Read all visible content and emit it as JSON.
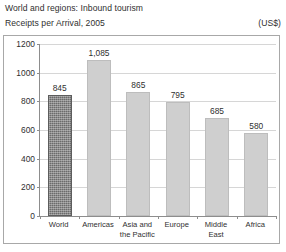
{
  "header": {
    "title_line1": "World and regions: Inbound tourism",
    "title_line2": "Receipts per Arrival, 2005",
    "units": "(US$)"
  },
  "chart_data": {
    "type": "bar",
    "xlabel": "",
    "ylabel": "",
    "units": "(US$)",
    "ylim": [
      0,
      1200
    ],
    "ytick_step": 200,
    "yticks": [
      "1200",
      "1000",
      "800",
      "600",
      "400",
      "200",
      "0"
    ],
    "ytick_values": [
      1200,
      1000,
      800,
      600,
      400,
      200,
      0
    ],
    "grid": true,
    "legend": "none",
    "categories": [
      "World",
      "Americas",
      "Asia and the Pacific",
      "Europe",
      "Middle East",
      "Africa"
    ],
    "values": [
      845,
      1085,
      865,
      795,
      685,
      580
    ],
    "value_labels": [
      "845",
      "1,085",
      "865",
      "795",
      "685",
      "580"
    ],
    "highlight_index": 0,
    "colors": {
      "bar": "#cfcfcf",
      "bar_highlight": "#6b6b6b",
      "grid": "#d6d6d6",
      "axis": "#8d8d8d",
      "frame": "#a8a8a8",
      "text": "#2f2f2f"
    }
  }
}
